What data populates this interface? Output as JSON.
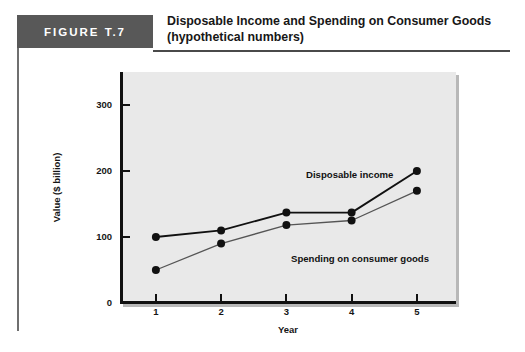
{
  "figure": {
    "badge_label": "FIGURE T.7",
    "title_line1": "Disposable Income and Spending on Consumer Goods",
    "title_line2": "(hypothetical numbers)"
  },
  "chart_data": {
    "type": "line",
    "title": "Disposable Income and Spending on Consumer Goods (hypothetical numbers)",
    "xlabel": "Year",
    "ylabel": "Value ($ billion)",
    "x": [
      1,
      2,
      3,
      4,
      5
    ],
    "xticklabels": [
      "1",
      "2",
      "3",
      "4",
      "5"
    ],
    "yticklabels": [
      "0",
      "100",
      "200",
      "300"
    ],
    "yticks": [
      0,
      100,
      200,
      300
    ],
    "xlim": [
      0.45,
      5.6
    ],
    "ylim": [
      0,
      350
    ],
    "grid": false,
    "legend": "inline-annotations",
    "series": [
      {
        "name": "Disposable income",
        "values": [
          100,
          110,
          137,
          137,
          200
        ],
        "color": "#111111",
        "marker": "circle"
      },
      {
        "name": "Spending on consumer goods",
        "values": [
          50,
          90,
          118,
          125,
          170
        ],
        "color": "#555555",
        "marker": "circle"
      }
    ],
    "annotations": [
      {
        "text": "Disposable income",
        "series": "Disposable income"
      },
      {
        "text": "Spending on consumer goods",
        "series": "Spending on consumer goods"
      }
    ]
  },
  "colors": {
    "badge_bg": "#585858",
    "plot_bg": "#e9e9e9",
    "axis": "#111111",
    "rule": "#4a4a4a"
  }
}
